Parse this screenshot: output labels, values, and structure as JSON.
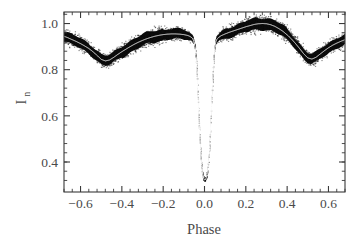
{
  "figure": {
    "background_color": "#ffffff",
    "ink_color": "#3a3a3a",
    "data_color": "#0b0b0b",
    "model_color": "#ffffff"
  },
  "axes": {
    "x_title": "Phase",
    "y_title_main": "I",
    "y_title_sub": "n",
    "x_tick_labels": [
      "−0.6",
      "−0.4",
      "−0.2",
      "0.0",
      "0.2",
      "0.4",
      "0.6"
    ],
    "x_tick_values": [
      -0.6,
      -0.4,
      -0.2,
      0.0,
      0.2,
      0.4,
      0.6
    ],
    "y_tick_labels": [
      "0.4",
      "0.6",
      "0.8",
      "1.0"
    ],
    "y_tick_values": [
      0.4,
      0.6,
      0.8,
      1.0
    ],
    "x_minor_per_interval": 4,
    "y_minor_per_interval": 4
  },
  "chart_data": {
    "type": "line",
    "title": "",
    "subtitle": "",
    "xlabel": "Phase",
    "ylabel": "I_n",
    "xlim": [
      -0.68,
      0.68
    ],
    "ylim": [
      0.27,
      1.05
    ],
    "grid": false,
    "legend": "none",
    "annotations": [],
    "series": [
      {
        "name": "Model light curve",
        "style": "white-line-over-scatter",
        "color": "#ffffff",
        "x": [
          -0.68,
          -0.66,
          -0.64,
          -0.62,
          -0.6,
          -0.58,
          -0.56,
          -0.54,
          -0.52,
          -0.5,
          -0.48,
          -0.46,
          -0.44,
          -0.42,
          -0.4,
          -0.38,
          -0.36,
          -0.34,
          -0.32,
          -0.3,
          -0.28,
          -0.26,
          -0.24,
          -0.22,
          -0.2,
          -0.18,
          -0.16,
          -0.14,
          -0.12,
          -0.1,
          -0.09,
          -0.08,
          -0.07,
          -0.06,
          -0.055,
          -0.05,
          -0.045,
          -0.04,
          -0.035,
          -0.03,
          -0.025,
          -0.02,
          -0.015,
          -0.01,
          -0.005,
          0.0,
          0.005,
          0.01,
          0.015,
          0.02,
          0.025,
          0.03,
          0.035,
          0.04,
          0.045,
          0.05,
          0.055,
          0.06,
          0.07,
          0.08,
          0.09,
          0.1,
          0.12,
          0.14,
          0.16,
          0.18,
          0.2,
          0.22,
          0.24,
          0.26,
          0.28,
          0.3,
          0.32,
          0.34,
          0.36,
          0.38,
          0.4,
          0.42,
          0.44,
          0.46,
          0.48,
          0.5,
          0.52,
          0.54,
          0.56,
          0.58,
          0.6,
          0.62,
          0.64,
          0.66,
          0.68
        ],
        "y": [
          0.945,
          0.938,
          0.93,
          0.922,
          0.913,
          0.903,
          0.892,
          0.878,
          0.862,
          0.845,
          0.838,
          0.842,
          0.853,
          0.866,
          0.878,
          0.889,
          0.9,
          0.91,
          0.919,
          0.927,
          0.934,
          0.94,
          0.945,
          0.949,
          0.952,
          0.954,
          0.955,
          0.955,
          0.954,
          0.952,
          0.95,
          0.948,
          0.944,
          0.938,
          0.93,
          0.918,
          0.893,
          0.845,
          0.76,
          0.655,
          0.552,
          0.462,
          0.397,
          0.354,
          0.331,
          0.322,
          0.324,
          0.336,
          0.361,
          0.404,
          0.468,
          0.558,
          0.662,
          0.766,
          0.85,
          0.898,
          0.921,
          0.932,
          0.941,
          0.947,
          0.951,
          0.955,
          0.962,
          0.968,
          0.974,
          0.98,
          0.986,
          0.991,
          0.996,
          0.999,
          1.0,
          0.999,
          0.995,
          0.988,
          0.978,
          0.966,
          0.951,
          0.934,
          0.914,
          0.892,
          0.869,
          0.851,
          0.846,
          0.854,
          0.868,
          0.882,
          0.895,
          0.906,
          0.915,
          0.923,
          0.93
        ]
      },
      {
        "name": "Observed photometry",
        "style": "dense-scatter-band",
        "color": "#0b0b0b",
        "scatter_half_width_out_of_eclipse": 0.022,
        "scatter_half_width_in_eclipse": 0.006,
        "note": "thousands of points forming a thick black band about the model"
      }
    ]
  }
}
